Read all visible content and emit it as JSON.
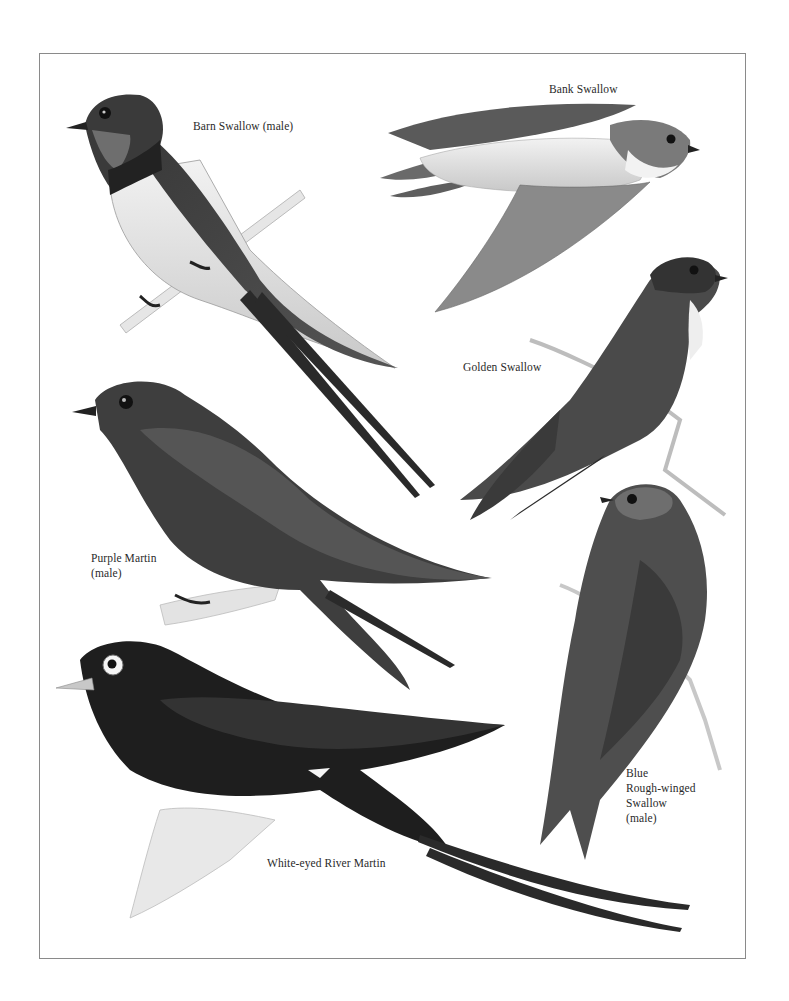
{
  "plate": {
    "title": "Swallows and Martins illustration plate",
    "colors": {
      "ink": "#1a1a1a",
      "dark": "#2e2e2e",
      "mid": "#5a5a5a",
      "light": "#d8d8d8",
      "frame": "#8a8a8a",
      "background": "#ffffff"
    }
  },
  "labels": [
    {
      "id": "barn-swallow",
      "text": "Barn Swallow (male)"
    },
    {
      "id": "bank-swallow",
      "text": "Bank Swallow"
    },
    {
      "id": "golden-swallow",
      "text": "Golden Swallow"
    },
    {
      "id": "purple-martin",
      "text": "Purple Martin\n(male)"
    },
    {
      "id": "blue-rough-winged-swallow",
      "text": "Blue\nRough-winged\nSwallow\n(male)"
    },
    {
      "id": "white-eyed-river-martin",
      "text": "White-eyed River Martin"
    }
  ]
}
